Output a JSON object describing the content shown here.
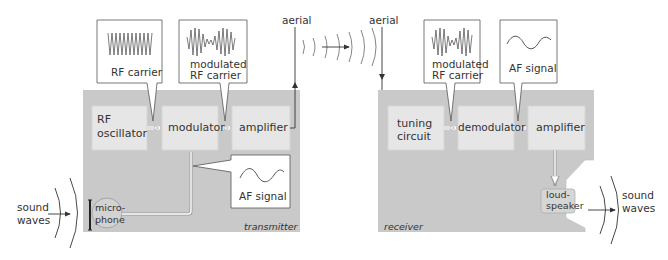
{
  "diagram": {
    "colors": {
      "panel": "#c9c9c9",
      "block": "#e6e6e6",
      "line": "#444444",
      "callout_bg": "#ffffff"
    },
    "transmitter": {
      "label": "transmitter",
      "blocks": {
        "rf_oscillator": "RF oscillator",
        "rf_oscillator_l1": "RF",
        "rf_oscillator_l2": "oscillator",
        "modulator": "modulator",
        "amplifier": "amplifier",
        "microphone_l1": "micro-",
        "microphone_l2": "phone"
      },
      "callouts": {
        "rf_carrier": "RF carrier",
        "modulated_l1": "modulated",
        "modulated_l2": "RF carrier",
        "af_signal": "AF signal"
      },
      "input_l1": "sound",
      "input_l2": "waves"
    },
    "aerial_tx": "aerial",
    "aerial_rx": "aerial",
    "receiver": {
      "label": "receiver",
      "blocks": {
        "tuning_l1": "tuning",
        "tuning_l2": "circuit",
        "demodulator": "demodulator",
        "amplifier": "amplifier",
        "loudspeaker_l1": "loud-",
        "loudspeaker_l2": "speaker"
      },
      "callouts": {
        "modulated_l1": "modulated",
        "modulated_l2": "RF carrier",
        "af_signal": "AF signal"
      },
      "output_l1": "sound",
      "output_l2": "waves"
    }
  }
}
